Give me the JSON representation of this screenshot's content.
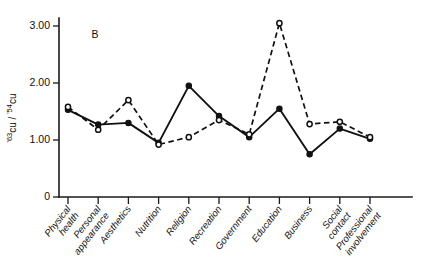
{
  "chart_data": {
    "type": "line",
    "title": "",
    "panel_label": "B",
    "xlabel": "",
    "ylabel": "'63cu / '54cu",
    "ylabel_parts": {
      "prefix_super": "63",
      "prefix_base": "cu",
      "separator": " / ",
      "suffix_super": "54",
      "suffix_base": "cu"
    },
    "categories": [
      "Physical health",
      "Personal appearance",
      "Aesthetics",
      "Nutrition",
      "Religion",
      "Recreation",
      "Government",
      "Education",
      "Business",
      "Social contact",
      "Professional involvement"
    ],
    "category_lines": [
      [
        "Physical",
        "health"
      ],
      [
        "Personal",
        "appearance"
      ],
      [
        "Aesthetics"
      ],
      [
        "Nutrition"
      ],
      [
        "Religion"
      ],
      [
        "Recreation"
      ],
      [
        "Government"
      ],
      [
        "Education"
      ],
      [
        "Business"
      ],
      [
        "Social",
        "contact"
      ],
      [
        "Professional",
        "involvement"
      ]
    ],
    "ylim": [
      0,
      3.3
    ],
    "yticks": [
      0,
      1.0,
      2.0,
      3.0
    ],
    "ytick_labels": [
      "0",
      "1.00",
      "2.00",
      "3.00"
    ],
    "grid": false,
    "legend_position": "none",
    "series": [
      {
        "name": "solid-filled",
        "marker": "filled-circle",
        "line_style": "solid",
        "values": [
          1.53,
          1.27,
          1.3,
          0.95,
          1.95,
          1.42,
          1.05,
          1.55,
          0.75,
          1.2,
          1.02
        ]
      },
      {
        "name": "dashed-open",
        "marker": "open-circle",
        "line_style": "dashed",
        "values": [
          1.58,
          1.18,
          1.7,
          0.92,
          1.05,
          1.35,
          1.1,
          3.05,
          1.28,
          1.32,
          1.05
        ]
      }
    ],
    "colors": {
      "axis": "#1a1a1a",
      "series": "#111111",
      "background": "#ffffff"
    }
  }
}
